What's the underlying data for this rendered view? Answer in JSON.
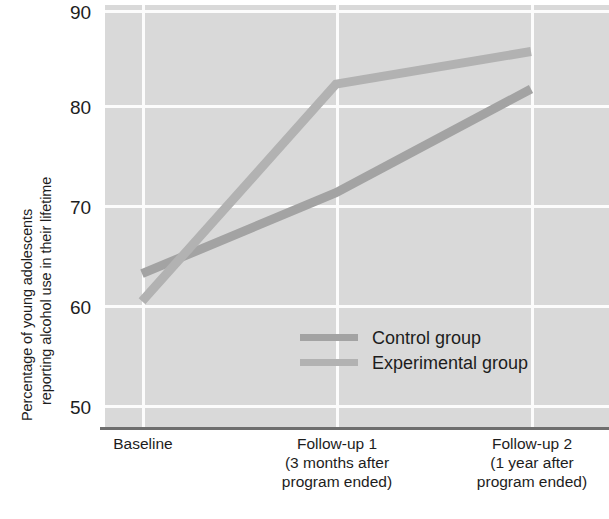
{
  "axes": {
    "ylabel_line1": "Percentage of young adolescents",
    "ylabel_line2": "reporting alcohol use in their lifetime",
    "yticks": [
      "90",
      "80",
      "70",
      "60",
      "50"
    ]
  },
  "legend": {
    "items": [
      {
        "label": "Control group",
        "color": "#a3a3a3"
      },
      {
        "label": "Experimental group",
        "color": "#b2b2b2"
      }
    ]
  },
  "xcats": [
    {
      "line1": "Baseline",
      "line2": "",
      "line3": ""
    },
    {
      "line1": "Follow-up 1",
      "line2": "(3 months after",
      "line3": "program ended)"
    },
    {
      "line1": "Follow-up 2",
      "line2": "(1 year after",
      "line3": "program ended)"
    }
  ],
  "colors": {
    "plot_background": "#d9d9d9",
    "gridline": "#fcfcfc",
    "axis_line": "#6e6e6e",
    "control_line": "#a3a3a3",
    "experimental_line": "#b2b2b2",
    "text": "#1d1d1d"
  },
  "chart_data": {
    "type": "line",
    "title": "",
    "xlabel": "",
    "ylabel": "Percentage of young adolescents reporting alcohol use in their lifetime",
    "categories": [
      "Baseline",
      "Follow-up 1 (3 months after program ended)",
      "Follow-up 2 (1 year after program ended)"
    ],
    "series": [
      {
        "name": "Control group",
        "values": [
          63.3,
          71.5,
          82.0
        ],
        "color": "#a3a3a3"
      },
      {
        "name": "Experimental group",
        "values": [
          60.5,
          82.5,
          85.8
        ],
        "color": "#b2b2b2"
      }
    ],
    "ylim": [
      50,
      90
    ],
    "yticks": [
      50,
      60,
      70,
      80,
      90
    ],
    "grid": true,
    "legend_position": "inside-center-lower"
  }
}
